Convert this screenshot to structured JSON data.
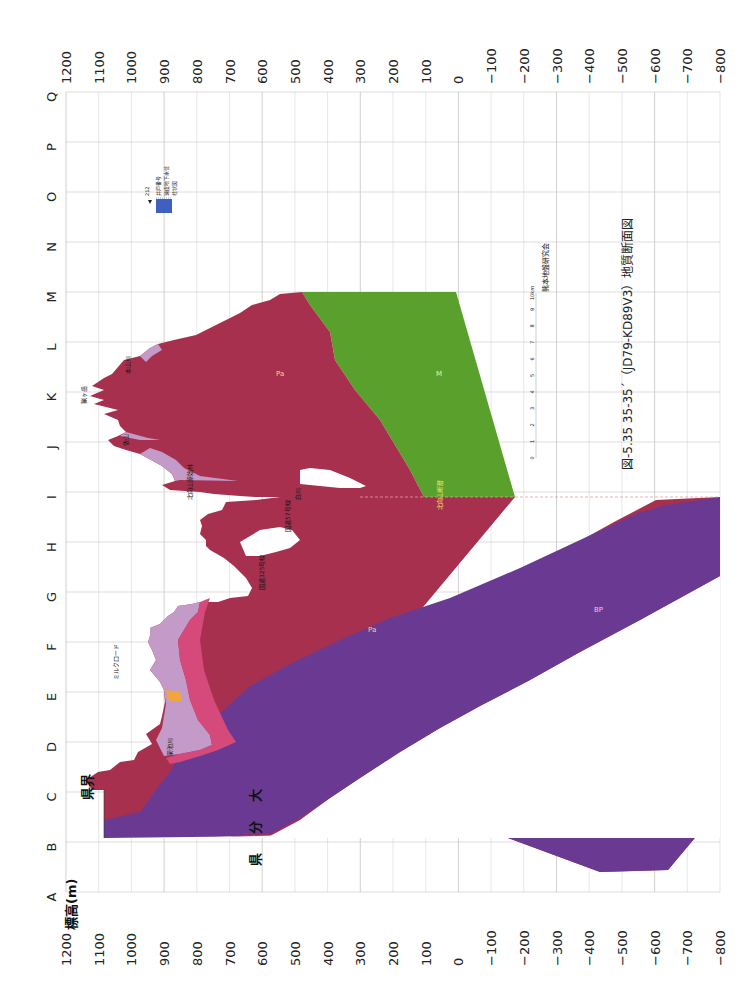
{
  "title": "図-5.35 35-35´（JD79-KD89V3）地質断面図",
  "organization": "熊本地盤研究会",
  "y_axis_label": "標高(m)",
  "elevation_ticks": [
    "1200",
    "1100",
    "1000",
    "900",
    "800",
    "700",
    "600",
    "500",
    "400",
    "300",
    "200",
    "100",
    "0",
    "−100",
    "−200",
    "−300",
    "−400",
    "−500",
    "−600",
    "−700",
    "−800"
  ],
  "column_letters": [
    "Q",
    "P",
    "O",
    "N",
    "M",
    "L",
    "K",
    "J",
    "I",
    "H",
    "G",
    "F",
    "E",
    "D",
    "C",
    "B",
    "A"
  ],
  "scale_bar": {
    "ticks": [
      "0",
      "1",
      "2",
      "3",
      "4",
      "5",
      "6",
      "7",
      "8",
      "9",
      "10km"
    ]
  },
  "legend": {
    "well_number": "212",
    "items": [
      "井戸番号",
      "速度地下水位",
      "柱状図"
    ]
  },
  "place_labels": {
    "kenkai": "県界",
    "oita": [
      "大",
      "分",
      "県"
    ],
    "peak_K": "猟ヶ岳",
    "river_L": "本山川",
    "mt_J": "俵山",
    "fault_I": "北向山原始林",
    "river_I": "白川",
    "line_H": "国道57号線",
    "fault_G": "国道325号線",
    "river_D": "菊池川",
    "road_F": "ミルクロード",
    "bottom_I": "北向山断層"
  },
  "unit_labels": {
    "main": "Pa",
    "green": "M",
    "purple": "BP"
  },
  "colors": {
    "main_volcanic": "#a8304f",
    "green_unit": "#5aa02c",
    "purple_basement": "#6a3a93",
    "lilac_cover": "#c49ac8",
    "pink_unit": "#d54a7a",
    "orange_unit": "#f0a63a",
    "grid": "#cfcfcf",
    "grid_dark": "#555555"
  },
  "chart_data": {
    "type": "area",
    "title": "図-5.35 35-35´（JD79-KD89V3）地質断面図",
    "orientation": "rotated 90° (distance runs bottom→top, elevation runs left→right)",
    "xlabel": "測線位置 (A→Q)",
    "ylabel": "標高(m)",
    "ylim": [
      -800,
      1200
    ],
    "categories": [
      "C",
      "D",
      "E",
      "F",
      "G",
      "H",
      "I",
      "J",
      "K",
      "L",
      "M"
    ],
    "series": [
      {
        "name": "地表面 (surface elevation, m)",
        "values": [
          970,
          820,
          880,
          920,
          880,
          810,
          255,
          960,
          1050,
          960,
          400
        ]
      },
      {
        "name": "Pa/BP境界 (top of basement, m)",
        "values": [
          100,
          110,
          100,
          -20,
          -230,
          -520,
          -800,
          null,
          null,
          null,
          null
        ]
      },
      {
        "name": "M層上面 (top of green unit, m)",
        "values": [
          null,
          null,
          null,
          null,
          null,
          null,
          -200,
          50,
          200,
          320,
          400
        ]
      }
    ],
    "grid": true
  }
}
